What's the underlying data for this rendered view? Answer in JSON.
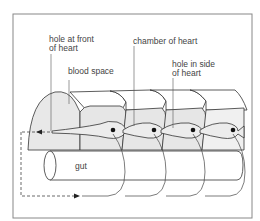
{
  "figure": {
    "labels": {
      "hole_front": "hole at front\nof heart",
      "blood_space": "blood space",
      "chamber": "chamber of heart",
      "hole_side": "hole in side\nof heart",
      "gut": "gut"
    },
    "colors": {
      "line": "#333333",
      "fill_light": "#e6e6e6",
      "fill_white": "#ffffff",
      "frame": "#777777"
    }
  }
}
